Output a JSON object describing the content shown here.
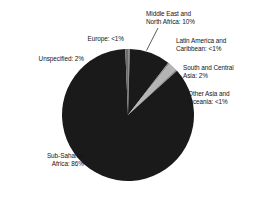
{
  "chart_data": {
    "type": "pie",
    "title": "",
    "subtitle": "",
    "xlabel": "",
    "ylabel": "",
    "legend_position": "none",
    "grid": false,
    "categories": [
      "Sub-Saharan Africa",
      "Europe",
      "Middle East and North Africa",
      "Latin America and Caribbean",
      "South and Central Asia",
      "Other Asia and Oceania",
      "Unspecified"
    ],
    "values": [
      86,
      0.5,
      10,
      0.5,
      2,
      0.5,
      2
    ],
    "value_labels": [
      "86%",
      "<1%",
      "10%",
      "<1%",
      "2%",
      "<1%",
      "2%"
    ],
    "start_angle_deg": 0,
    "direction": "clockwise",
    "slices": [
      {
        "name": "Europe",
        "label": "Europe: <1%",
        "value": 0.5,
        "value_label": "<1%",
        "color": "#8d8d8d",
        "start_deg": 0,
        "sweep_deg": 1.6
      },
      {
        "name": "Middle East and North Africa",
        "label": "Middle East and North Africa: 10%",
        "value": 10,
        "value_label": "10%",
        "color": "#1a1a1a",
        "start_deg": 1.6,
        "sweep_deg": 36.0
      },
      {
        "name": "Latin America and Caribbean",
        "label": "Latin America and Caribbean: <1%",
        "value": 0.5,
        "value_label": "<1%",
        "color": "#8d8d8d",
        "start_deg": 37.6,
        "sweep_deg": 1.6
      },
      {
        "name": "South and Central Asia",
        "label": "South and Central Asia: 2%",
        "value": 2,
        "value_label": "2%",
        "color": "#b4b4b4",
        "start_deg": 39.2,
        "sweep_deg": 7.2
      },
      {
        "name": "Other Asia and Oceania",
        "label": "Other Asia and Oceania: <1%",
        "value": 0.5,
        "value_label": "<1%",
        "color": "#8d8d8d",
        "start_deg": 46.4,
        "sweep_deg": 1.6
      },
      {
        "name": "Sub-Saharan Africa",
        "label": "Sub-Saharan Africa: 86%",
        "value": 86,
        "value_label": "86%",
        "color": "#1a1a1a",
        "start_deg": 48.0,
        "sweep_deg": 309.6
      },
      {
        "name": "Unspecified",
        "label": "Unspecified: 2%",
        "value": 2,
        "value_label": "2%",
        "color": "#6e6e6e",
        "start_deg": 357.6,
        "sweep_deg": 2.4
      }
    ]
  },
  "labels": {
    "middle_east_north_africa": "Middle East and\nNorth Africa: 10%",
    "latin_america_caribbean": "Latin America and\nCaribbean: <1%",
    "south_central_asia": "South and Central\nAsia: 2%",
    "other_asia_oceania": "Other Asia and\nOceania: <1%",
    "europe": "Europe: <1%",
    "unspecified": "Unspecified: 2%",
    "sub_saharan_africa": "Sub-Saharan\nAfrica: 86%"
  },
  "colors": {
    "background": "#ffffff",
    "dark_slice": "#1a1a1a",
    "mid_slice": "#6e6e6e",
    "light_slice": "#b4b4b4",
    "hairline_slice": "#8d8d8d",
    "text": "#141414",
    "leader_line": "#4a4a4a"
  },
  "geometry": {
    "center_x": 128,
    "center_y": 115,
    "radius": 66
  }
}
